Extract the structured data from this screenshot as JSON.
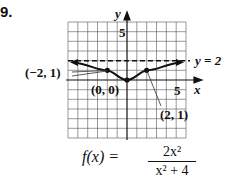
{
  "problem": {
    "number": "9."
  },
  "graph": {
    "x_range": [
      -6,
      6
    ],
    "y_range": [
      -6,
      6
    ],
    "y_axis_label": "y",
    "x_axis_label": "x",
    "y_tick_label": "5",
    "x_tick_label": "5",
    "asymptote_label": "y = 2",
    "asymptote_y": 2,
    "points": [
      {
        "label": "(−2, 1)",
        "x": -2,
        "y": 1
      },
      {
        "label": "(0, 0)",
        "x": 0,
        "y": 0
      },
      {
        "label": "(2, 1)",
        "x": 2,
        "y": 1
      }
    ]
  },
  "formula": {
    "lhs": "f(x) =",
    "numerator": "2x²",
    "denominator": "x² + 4"
  }
}
